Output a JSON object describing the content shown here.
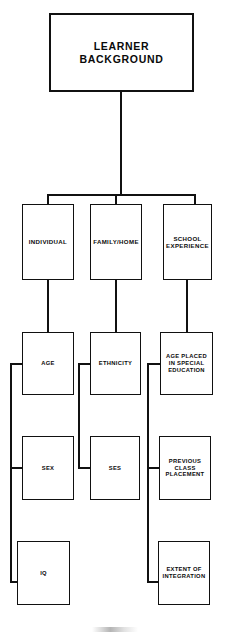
{
  "diagram": {
    "type": "hierarchy-tree",
    "title": "Learner Background",
    "root": {
      "id": "root",
      "label": "LEARNER BACKGROUND"
    },
    "categories": [
      {
        "id": "individual",
        "label": "INDIVIDUAL"
      },
      {
        "id": "family",
        "label": "FAMILY/HOME"
      },
      {
        "id": "school",
        "label": "SCHOOL\nEXPERIENCE"
      }
    ],
    "attributes": {
      "individual": [
        {
          "id": "age",
          "label": "AGE"
        },
        {
          "id": "sex",
          "label": "SEX"
        },
        {
          "id": "iq",
          "label": "IQ"
        }
      ],
      "family": [
        {
          "id": "ethnicity",
          "label": "ETHNICITY"
        },
        {
          "id": "ses",
          "label": "SES"
        }
      ],
      "school": [
        {
          "id": "ageplaced",
          "label": "AGE PLACED\nIN SPECIAL\nEDUCATION"
        },
        {
          "id": "previous",
          "label": "PREVIOUS\nCLASS\nPLACEMENT"
        },
        {
          "id": "extent",
          "label": "EXTENT OF\nINTEGRATION"
        }
      ]
    },
    "colors": {
      "line": "#111111",
      "box_fill": "#ffffff",
      "text": "#0a0a0a"
    }
  }
}
